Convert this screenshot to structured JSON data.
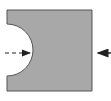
{
  "diagram": {
    "shape": {
      "type": "rectangle-with-semicircular-notch",
      "fill": "#a8a8a8",
      "stroke": "#555555",
      "x": 7,
      "y": 10,
      "width": 85,
      "height": 81,
      "notch": {
        "side": "left",
        "center_y": 50,
        "radius": 26
      }
    },
    "arrows": [
      {
        "id": "left-dashed",
        "style": "dashed",
        "direction": "right",
        "x1": 5,
        "y1": 53,
        "x2": 30,
        "y2": 53,
        "color": "#222222"
      },
      {
        "id": "right-solid",
        "style": "solid",
        "direction": "left",
        "x1": 111,
        "y1": 53,
        "x2": 97,
        "y2": 53,
        "color": "#222222"
      }
    ]
  }
}
